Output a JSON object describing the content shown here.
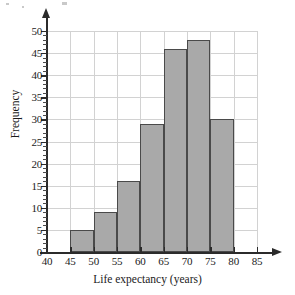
{
  "chart_data": {
    "type": "bar",
    "title": "",
    "xlabel": "Life expectancy (years)",
    "ylabel": "Frequency",
    "xlim": [
      40,
      85
    ],
    "ylim": [
      0,
      50
    ],
    "grid": true,
    "legend": null,
    "bin_width": 5,
    "bins": [
      {
        "start": 45,
        "end": 50,
        "value": 5
      },
      {
        "start": 50,
        "end": 55,
        "value": 9
      },
      {
        "start": 55,
        "end": 60,
        "value": 16
      },
      {
        "start": 60,
        "end": 65,
        "value": 29
      },
      {
        "start": 65,
        "end": 70,
        "value": 46
      },
      {
        "start": 70,
        "end": 75,
        "value": 48
      },
      {
        "start": 75,
        "end": 80,
        "value": 30
      }
    ],
    "categories": [
      "45-50",
      "50-55",
      "55-60",
      "60-65",
      "65-70",
      "70-75",
      "75-80"
    ],
    "values": [
      5,
      9,
      16,
      29,
      46,
      48,
      30
    ],
    "x_ticks": [
      40,
      45,
      50,
      55,
      60,
      65,
      70,
      75,
      80,
      85
    ],
    "y_ticks": [
      0,
      5,
      10,
      15,
      20,
      25,
      30,
      35,
      40,
      45,
      50
    ],
    "colors": {
      "bar_fill": "#a9a9a9",
      "bar_stroke": "#4a4a4a",
      "grid": "#d2d2d2",
      "axis": "#2b2b2b",
      "background": "#ffffff",
      "text": "#1a1a1a"
    }
  }
}
